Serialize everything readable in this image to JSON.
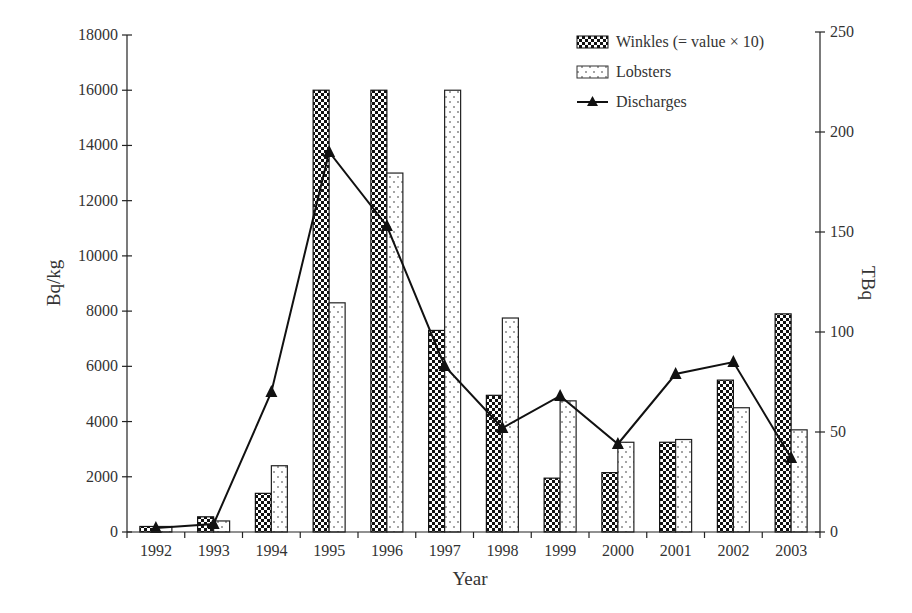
{
  "chart_data": {
    "type": "bar",
    "title": "",
    "xlabel": "Year",
    "ylabel": "Bq/kg",
    "y2label": "TBq",
    "ylim": [
      0,
      18000
    ],
    "y2lim": [
      0,
      250
    ],
    "yticks": [
      0,
      2000,
      4000,
      6000,
      8000,
      10000,
      12000,
      14000,
      16000,
      18000
    ],
    "y2ticks": [
      0,
      50,
      100,
      150,
      200,
      250
    ],
    "grid": false,
    "legend_position": "top-right",
    "categories": [
      "1992",
      "1993",
      "1994",
      "1995",
      "1996",
      "1997",
      "1998",
      "1999",
      "2000",
      "2001",
      "2002",
      "2003"
    ],
    "series": [
      {
        "name": "Winkles (= value × 10)",
        "type": "bar",
        "axis": "left",
        "pattern": "checker",
        "values": [
          200,
          550,
          1400,
          16000,
          16000,
          7300,
          4950,
          1950,
          2150,
          3250,
          5500,
          7900
        ]
      },
      {
        "name": "Lobsters",
        "type": "bar",
        "axis": "left",
        "pattern": "dotted",
        "values": [
          200,
          400,
          2400,
          8300,
          13000,
          16000,
          7750,
          4750,
          3250,
          3350,
          4500,
          3700
        ]
      },
      {
        "name": "Discharges",
        "type": "line",
        "axis": "right",
        "marker": "triangle",
        "values": [
          2,
          4,
          70,
          190,
          153,
          83,
          52,
          68,
          44,
          79,
          85,
          37
        ]
      }
    ]
  },
  "legend": {
    "items": [
      "Winkles (= value × 10)",
      "Lobsters",
      "Discharges"
    ]
  }
}
